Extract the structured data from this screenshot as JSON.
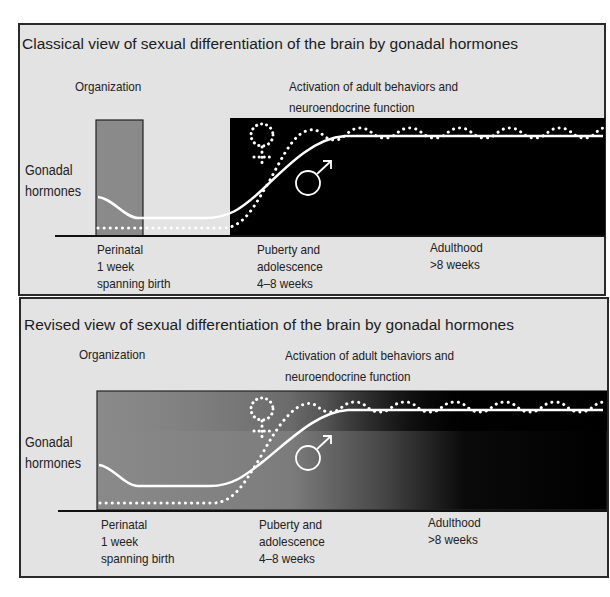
{
  "panels": [
    {
      "title": "Classical view of sexual differentiation of the brain by gonadal hormones",
      "organization_label": "Organization",
      "activation_label": "Activation of adult behaviors and\nneuroendocrine function",
      "yaxis_label": "Gonadal\nhormones",
      "periods": [
        {
          "label": "Perinatal\n1 week\nspanning birth"
        },
        {
          "label": "Puberty and\nadolescence\n4–8 weeks"
        },
        {
          "label": "Adulthood\n>8 weeks"
        }
      ],
      "symbols": {
        "female": "female-symbol",
        "male": "male-symbol"
      },
      "shading": "discrete: grey perinatal window, black activation period"
    },
    {
      "title": "Revised view of sexual differentiation of the brain by gonadal hormones",
      "organization_label": "Organization",
      "activation_label": "Activation of adult behaviors and\nneuroendocrine function",
      "yaxis_label": "Gonadal\nhormones",
      "periods": [
        {
          "label": "Perinatal\n1 week\nspanning birth"
        },
        {
          "label": "Puberty and\nadolescence\n4–8 weeks"
        },
        {
          "label": "Adulthood\n>8 weeks"
        }
      ],
      "symbols": {
        "female": "female-symbol",
        "male": "male-symbol"
      },
      "shading": "continuous gradient: grey to black across puberty into adulthood"
    }
  ],
  "colors": {
    "panel_bg": "#e3e3e3",
    "organization_grey": "#8a8a8a",
    "activation_black": "#000000",
    "male_line": "#ffffff",
    "female_dots": "#ffffff"
  }
}
